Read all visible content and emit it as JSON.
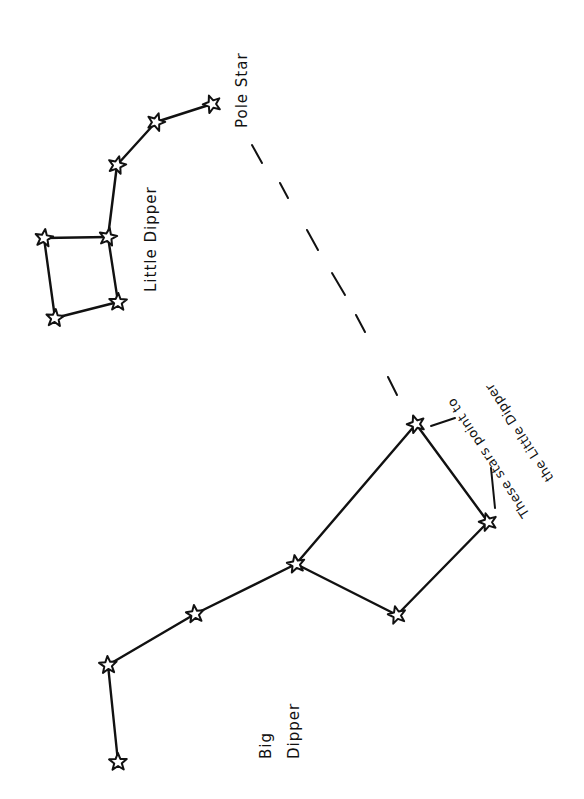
{
  "diagram": {
    "background": "#ffffff",
    "ink_color": "#111111",
    "labels": {
      "pole_star": "Pole Star",
      "little_dipper": "Little Dipper",
      "big_dipper_line1": "Big",
      "big_dipper_line2": "Dipper",
      "pointer_note_line1": "These stars point to",
      "pointer_note_line2": "the Little Dipper"
    },
    "constellations": [
      {
        "name": "Little Dipper",
        "stars": [
          {
            "id": "polaris",
            "x": 212,
            "y": 104,
            "role": "Pole Star"
          },
          {
            "id": "ld2",
            "x": 156,
            "y": 122
          },
          {
            "id": "ld3",
            "x": 117,
            "y": 165
          },
          {
            "id": "ld4",
            "x": 108,
            "y": 237
          },
          {
            "id": "ld5",
            "x": 44,
            "y": 238
          },
          {
            "id": "ld6",
            "x": 55,
            "y": 318
          },
          {
            "id": "ld7",
            "x": 118,
            "y": 302
          }
        ],
        "edges": [
          [
            "polaris",
            "ld2"
          ],
          [
            "ld2",
            "ld3"
          ],
          [
            "ld3",
            "ld4"
          ],
          [
            "ld4",
            "ld5"
          ],
          [
            "ld5",
            "ld6"
          ],
          [
            "ld6",
            "ld7"
          ],
          [
            "ld7",
            "ld4"
          ]
        ]
      },
      {
        "name": "Big Dipper",
        "stars": [
          {
            "id": "bd1",
            "x": 118,
            "y": 762
          },
          {
            "id": "bd2",
            "x": 108,
            "y": 665
          },
          {
            "id": "bd3",
            "x": 195,
            "y": 614
          },
          {
            "id": "bd4",
            "x": 296,
            "y": 564
          },
          {
            "id": "bd5",
            "x": 397,
            "y": 615
          },
          {
            "id": "bd6",
            "x": 488,
            "y": 522,
            "role": "pointer"
          },
          {
            "id": "bd7",
            "x": 416,
            "y": 424,
            "role": "pointer"
          }
        ],
        "edges": [
          [
            "bd1",
            "bd2"
          ],
          [
            "bd2",
            "bd3"
          ],
          [
            "bd3",
            "bd4"
          ],
          [
            "bd4",
            "bd5"
          ],
          [
            "bd5",
            "bd6"
          ],
          [
            "bd6",
            "bd7"
          ],
          [
            "bd7",
            "bd4"
          ]
        ]
      }
    ],
    "pointer_line": {
      "style": "dashed",
      "from": "bd7",
      "to": "polaris",
      "dashes": [
        [
          252,
          145,
          262,
          163
        ],
        [
          280,
          183,
          288,
          198
        ],
        [
          307,
          230,
          318,
          250
        ],
        [
          332,
          273,
          345,
          295
        ],
        [
          356,
          315,
          365,
          332
        ],
        [
          388,
          377,
          397,
          395
        ]
      ]
    }
  }
}
